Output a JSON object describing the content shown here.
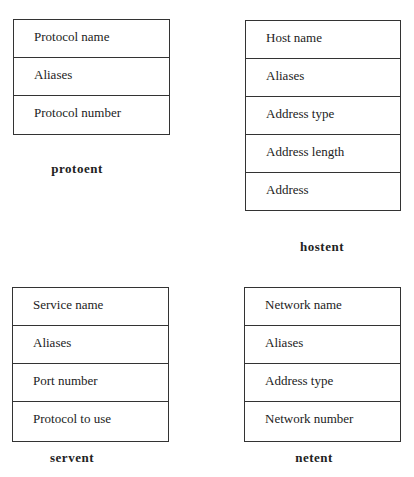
{
  "diagram": {
    "structures": [
      {
        "name": "protoent",
        "fields": [
          "Protocol name",
          "Aliases",
          "Protocol number"
        ]
      },
      {
        "name": "hostent",
        "fields": [
          "Host name",
          "Aliases",
          "Address type",
          "Address length",
          "Address"
        ]
      },
      {
        "name": "servent",
        "fields": [
          "Service name",
          "Aliases",
          "Port number",
          "Protocol to use"
        ]
      },
      {
        "name": "netent",
        "fields": [
          "Network name",
          "Aliases",
          "Address type",
          "Network number"
        ]
      }
    ]
  }
}
